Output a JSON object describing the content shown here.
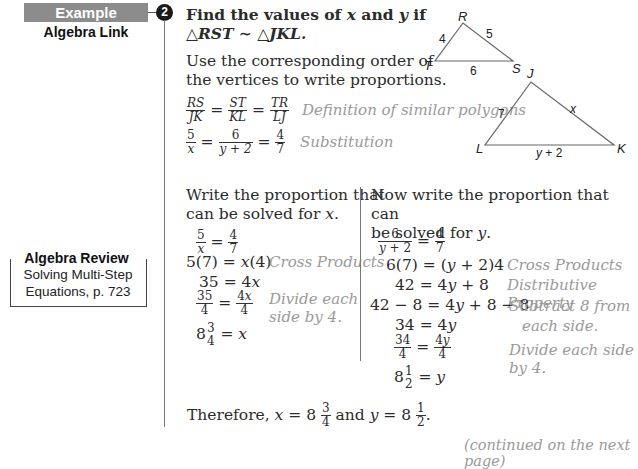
{
  "sidebar": {
    "banner_label": "Example",
    "example_number": "2",
    "subtitle": "Algebra Link",
    "review": {
      "title": "Algebra Review",
      "line1": "Solving Multi-Step",
      "line2": "Equations, p. 723"
    }
  },
  "problem": {
    "line1": "Find the values of x and y if",
    "line2": "△RST ∼ △JKL.",
    "instr1": "Use the corresponding order of",
    "instr2": "the vertices to write proportions."
  },
  "proportions": {
    "row1": {
      "a_num": "RS",
      "a_den": "JK",
      "b_num": "ST",
      "b_den": "KL",
      "c_num": "TR",
      "c_den": "LJ",
      "note": "Definition of similar polygons"
    },
    "row2": {
      "a_num": "5",
      "a_den": "x",
      "b_num": "6",
      "b_den": "y + 2",
      "c_num": "4",
      "c_den": "7",
      "note": "Substitution"
    }
  },
  "diagram": {
    "small_triangle": {
      "vertices": [
        "R",
        "S",
        "T"
      ],
      "sides": {
        "RT": "4",
        "RS": "5",
        "TS": "6"
      }
    },
    "large_triangle": {
      "vertices": [
        "J",
        "K",
        "L"
      ],
      "sides": {
        "JL": "7",
        "JK": "x",
        "LK": "y + 2"
      }
    }
  },
  "left_col": {
    "intro1": "Write the proportion that",
    "intro2": "can be solved for x.",
    "steps": [
      {
        "expr": "5/x = 4/7",
        "note": ""
      },
      {
        "expr": "5(7) = x(4)",
        "note": "Cross Products"
      },
      {
        "expr": "35 = 4x",
        "note": ""
      },
      {
        "expr": "35/4 = 4x/4",
        "note": "Divide each side by 4."
      },
      {
        "expr": "8 3/4 = x",
        "note": ""
      }
    ],
    "s2": "5(7) = x(4)",
    "s2_note": "Cross Products",
    "s3": "35 = 4x",
    "s4_note1": "Divide each",
    "s4_note2": "side by 4.",
    "s5_tail": "= x"
  },
  "right_col": {
    "intro1": "Now write the proportion that can",
    "intro2": "be solved for y.",
    "s2": "6(7) = (y + 2)4",
    "s2_note": "Cross Products",
    "s3": "42 = 4y + 8",
    "s3_note": "Distributive Property",
    "s4": "42 − 8 = 4y + 8 − 8",
    "s4_note1": "Subtract 8 from",
    "s4_note2": "each side.",
    "s5": "34 = 4y",
    "s6_note": "Divide each side by 4.",
    "s7_tail": "= y"
  },
  "conclusion": {
    "text_a": "Therefore, ",
    "x_value": "8 3/4",
    "y_value": "8 1/2"
  },
  "footer": {
    "continued": "(continued on the next page)"
  }
}
